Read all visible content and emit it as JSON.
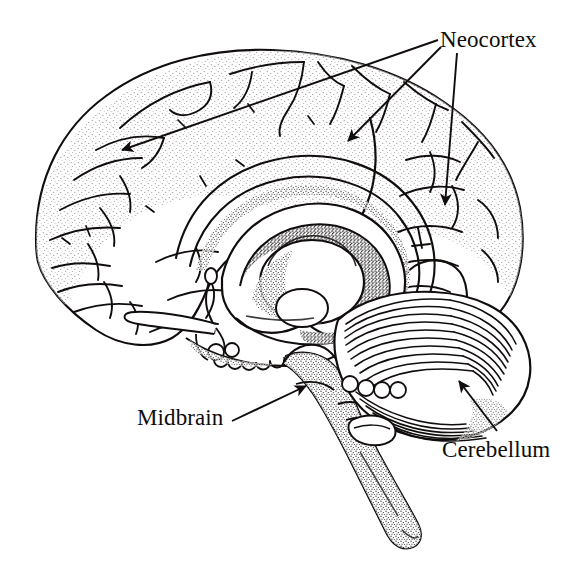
{
  "figure": {
    "kind": "anatomical-illustration",
    "style": "pen-and-ink line drawing with stipple shading",
    "background_color": "#ffffff",
    "ink_color": "#100d0c",
    "width": 588,
    "height": 569
  },
  "labels": {
    "neocortex": "Neocortex",
    "midbrain": "Midbrain",
    "cerebellum": "Cerebellum"
  },
  "annotations": [
    {
      "id": "neocortex-frontal",
      "label": "Neocortex",
      "leader_from": [
        438,
        40
      ],
      "leader_to": [
        122,
        150
      ],
      "arrowhead": "at-target"
    },
    {
      "id": "neocortex-parietal",
      "label": "Neocortex",
      "leader_from": [
        441,
        47
      ],
      "leader_to": [
        348,
        141
      ],
      "arrowhead": "at-target"
    },
    {
      "id": "neocortex-occipital",
      "label": "Neocortex",
      "leader_from": [
        457,
        53
      ],
      "leader_to": [
        445,
        205
      ],
      "arrowhead": "at-target"
    },
    {
      "id": "midbrain-pointer",
      "label": "Midbrain",
      "leader_from": [
        232,
        421
      ],
      "leader_to": [
        306,
        386
      ],
      "arrowhead": "at-target"
    },
    {
      "id": "cerebellum-pointer",
      "label": "Cerebellum",
      "leader_from": [
        497,
        431
      ],
      "leader_to": [
        459,
        381
      ],
      "arrowhead": "at-target"
    }
  ],
  "structures": [
    {
      "name": "cerebral-cortex",
      "note": "gyri and sulci, stippled margins"
    },
    {
      "name": "corpus-callosum",
      "note": "central arching band"
    },
    {
      "name": "thalamus",
      "note": "oval mass below corpus callosum"
    },
    {
      "name": "cerebellum",
      "note": "striated folia, lower right"
    },
    {
      "name": "brainstem",
      "note": "stippled column descending to lower right"
    },
    {
      "name": "optic-nerve",
      "note": "thin process at lower left of midline"
    }
  ]
}
